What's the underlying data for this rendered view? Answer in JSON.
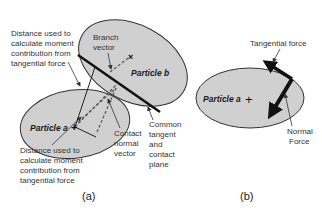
{
  "figure": {
    "panel_a": {
      "caption": "(a)",
      "particle_a_label": "Particle a",
      "particle_b_label": "Particle b",
      "annotations": {
        "distance_top": [
          "Distance used to",
          "calculate moment",
          "contribution from",
          "tangential force"
        ],
        "distance_bottom": [
          "Distance used to",
          "calculate moment",
          "contribution from",
          "tangential force"
        ],
        "branch_vector": [
          "Branch",
          "vector"
        ],
        "contact_normal": [
          "Contact",
          "normal",
          "vector"
        ],
        "common_tangent": [
          "Common",
          "tangent",
          "and",
          "contact",
          "plane"
        ]
      }
    },
    "panel_b": {
      "caption": "(b)",
      "particle_a_label": "Particle a",
      "annotations": {
        "tangential_force": "Tangential force",
        "normal_force": [
          "Normal",
          "Force"
        ]
      }
    },
    "colors": {
      "particle_fill": "#d0d0d0",
      "outline": "#333333",
      "text": "#333333"
    }
  }
}
